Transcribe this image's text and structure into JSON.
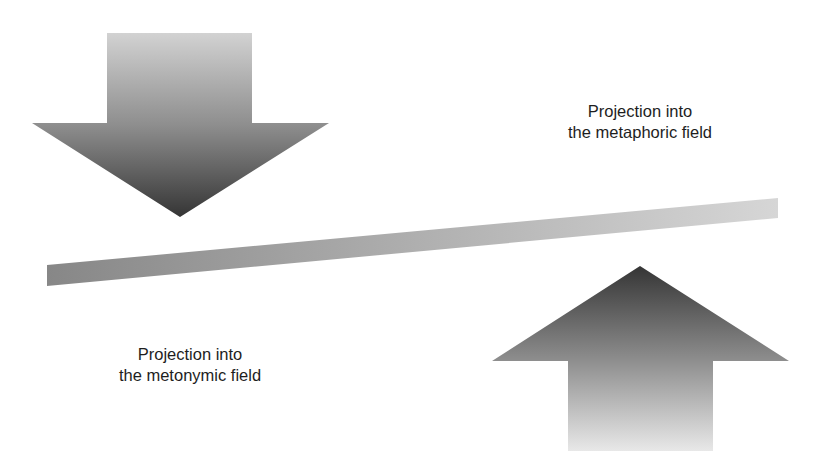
{
  "diagram": {
    "labels": {
      "metaphoric": {
        "line1": "Projection into",
        "line2": "the metaphoric field"
      },
      "metonymic": {
        "line1": "Projection into",
        "line2": "the metonymic field"
      }
    },
    "shapes": {
      "down_arrow": {
        "direction": "down",
        "gradient": [
          "#cfcfcf",
          "#3a3a3a"
        ]
      },
      "up_arrow": {
        "direction": "up",
        "gradient": [
          "#3a3a3a",
          "#e6e6e6"
        ]
      },
      "axis_bar": {
        "gradient": [
          "#8a8a8a",
          "#d4d4d4"
        ]
      }
    }
  }
}
